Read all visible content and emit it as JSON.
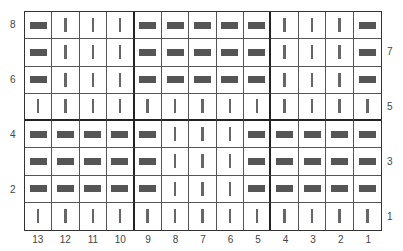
{
  "chart": {
    "title": "",
    "columns": [
      "13",
      "12",
      "11",
      "10",
      "9",
      "8",
      "7",
      "6",
      "5",
      "4",
      "3",
      "2",
      "1"
    ],
    "left_row_labels": [
      {
        "row": "8",
        "index": 0
      },
      {
        "row": "6",
        "index": 2
      },
      {
        "row": "4",
        "index": 4
      },
      {
        "row": "2",
        "index": 6
      }
    ],
    "right_row_labels": [
      {
        "row": "7",
        "index": 1
      },
      {
        "row": "5",
        "index": 3
      },
      {
        "row": "3",
        "index": 5
      },
      {
        "row": "1",
        "index": 7
      }
    ],
    "legend": {
      "knit_symbol": "vertical-bar",
      "purl_symbol": "horizontal-dash"
    },
    "rows": [
      [
        "P",
        "K",
        "K",
        "K",
        "P",
        "P",
        "P",
        "P",
        "P",
        "K",
        "K",
        "K",
        "P"
      ],
      [
        "P",
        "K",
        "K",
        "K",
        "P",
        "P",
        "P",
        "P",
        "P",
        "K",
        "K",
        "K",
        "P"
      ],
      [
        "P",
        "K",
        "K",
        "K",
        "P",
        "P",
        "P",
        "P",
        "P",
        "K",
        "K",
        "K",
        "P"
      ],
      [
        "K",
        "K",
        "K",
        "K",
        "K",
        "K",
        "K",
        "K",
        "K",
        "K",
        "K",
        "K",
        "K"
      ],
      [
        "P",
        "P",
        "P",
        "P",
        "P",
        "K",
        "K",
        "K",
        "P",
        "P",
        "P",
        "P",
        "P"
      ],
      [
        "P",
        "P",
        "P",
        "P",
        "P",
        "K",
        "K",
        "K",
        "P",
        "P",
        "P",
        "P",
        "P"
      ],
      [
        "P",
        "P",
        "P",
        "P",
        "P",
        "K",
        "K",
        "K",
        "P",
        "P",
        "P",
        "P",
        "P"
      ],
      [
        "K",
        "K",
        "K",
        "K",
        "K",
        "K",
        "K",
        "K",
        "K",
        "K",
        "K",
        "K",
        "K"
      ]
    ],
    "thick_vertical_after_col_index": [
      3,
      8
    ],
    "thick_horizontal_after_row_index": [
      3
    ]
  }
}
